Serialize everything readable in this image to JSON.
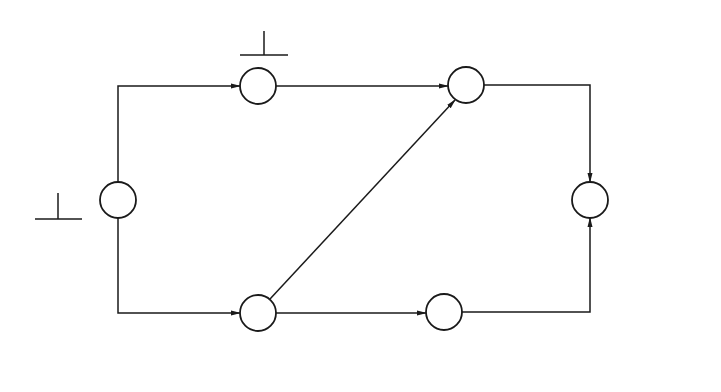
{
  "diagram": {
    "type": "activity-on-arrow network (time-scaled schedule with crash durations)",
    "nodes": [
      {
        "id": "1",
        "label": "1",
        "times": {
          "left": "0",
          "right": "0"
        }
      },
      {
        "id": "2",
        "label": "2",
        "times": {
          "left": "40",
          "right": "40"
        }
      },
      {
        "id": "3",
        "label": "3",
        "times": {
          "left": "25",
          "right": "25"
        }
      },
      {
        "id": "4",
        "label": "4",
        "times": {
          "left": "55",
          "right": "55"
        }
      },
      {
        "id": "5",
        "label": "5",
        "times": {
          "left": "55",
          "right": "70"
        }
      },
      {
        "id": "6",
        "label": "6",
        "times": {
          "left": "105",
          "right": "105"
        }
      }
    ],
    "activities": [
      {
        "name": "A",
        "from": "1",
        "to": "2",
        "duration": "40( 30)"
      },
      {
        "name": "B",
        "from": "1",
        "to": "3",
        "duration": "25"
      },
      {
        "name": "C",
        "from": "2",
        "to": "4",
        "duration": "15"
      },
      {
        "name": "D",
        "from": "3",
        "to": "4",
        "duration": "30"
      },
      {
        "name": "E",
        "from": "3",
        "to": "5",
        "duration": "30( 20)"
      },
      {
        "name": "F",
        "from": "4",
        "to": "6",
        "duration": "50( 45)"
      },
      {
        "name": "G",
        "from": "5",
        "to": "6",
        "duration": "40( 35)"
      }
    ],
    "colors": {
      "line": "#1a1a1a",
      "background": "#ffffff"
    }
  }
}
